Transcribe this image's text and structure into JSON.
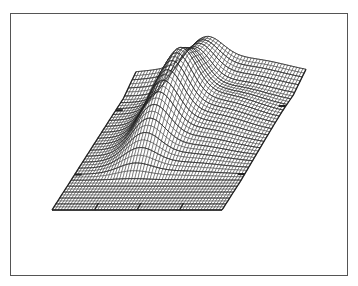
{
  "chart_data": {
    "type": "surface",
    "title": "",
    "xlabel": "",
    "ylabel": "",
    "zlabel": "",
    "grid": true,
    "legend": null,
    "style": {
      "line_color": "#222222",
      "frame_color": "#555555",
      "background": "#ffffff"
    },
    "base_plane": {
      "front_left": [
        52,
        210
      ],
      "front_right": [
        222,
        210
      ],
      "back_left": [
        136,
        79
      ],
      "back_right": [
        306,
        79
      ]
    },
    "mesh": {
      "nu": 56,
      "nv": 44
    },
    "surface_description": "Gaussian ridge running from front to back along the left third of the plane, amplitude growing with depth, with a saddle near the back edge; flat elsewhere",
    "ridge": {
      "center_u": 0.33,
      "width_u": 0.14,
      "max_height_px": 58,
      "start_v": 0.22,
      "peak_v": 0.72,
      "back_plateau_height_px": 12
    },
    "ticks": {
      "front_edge_u": [
        0.25,
        0.5,
        0.75
      ],
      "left_edge_v": [
        0.27,
        0.76
      ],
      "right_edge_v": [
        0.27,
        0.76
      ]
    }
  }
}
